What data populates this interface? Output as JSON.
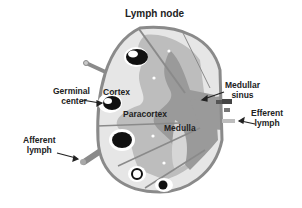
{
  "title": "Lymph node",
  "labels": {
    "germinal_center_line1": "Germinal",
    "germinal_center_line2": "center",
    "cortex": "Cortex",
    "paracortex": "Paracortex",
    "medulla": "Medulla",
    "medullar_sinus_line1": "Medullar",
    "medullar_sinus_line2": "sinus",
    "efferent_lymph_line1": "Efferent",
    "efferent_lymph_line2": "lymph",
    "afferent_lymph_line1": "Afferent",
    "afferent_lymph_line2": "lymph"
  },
  "colors": {
    "capsule": "#8a8a8a",
    "cortex_light": "#e6e6e6",
    "paracortex_mid": "#bdbdbd",
    "medulla_dark": "#9a9a9a",
    "follicle": "#111111",
    "text": "#222222"
  }
}
